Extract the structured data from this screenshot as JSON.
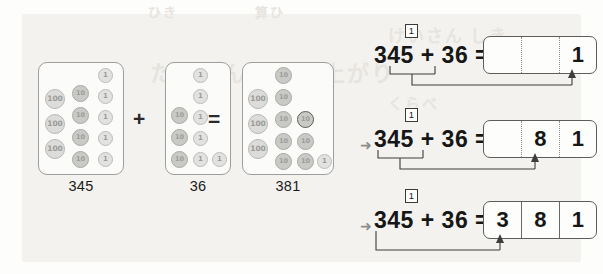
{
  "page": {
    "background_color": "#f3f2ef",
    "ink_color": "#161616"
  },
  "bleed_text": [
    "ひき",
    "算ひ",
    "けいさん",
    "しき",
    "たしざん",
    "くり上がり",
    "くらべ"
  ],
  "coin_model": {
    "operator_plus": "+",
    "operator_equals": "=",
    "groups": [
      {
        "name": "addend-1",
        "label": "345",
        "coins": {
          "hundreds": 3,
          "tens": 4,
          "ones": 5
        },
        "coin_faces": {
          "hundreds": "100",
          "tens": "10",
          "ones": "1"
        }
      },
      {
        "name": "addend-2",
        "label": "36",
        "coins": {
          "hundreds": 0,
          "tens": 3,
          "ones": 6
        },
        "coin_faces": {
          "hundreds": "100",
          "tens": "10",
          "ones": "1"
        }
      },
      {
        "name": "sum",
        "label": "381",
        "coins": {
          "hundreds": 3,
          "tens": 8,
          "ones": 1
        },
        "coin_faces": {
          "hundreds": "100",
          "tens": "10",
          "ones": "1"
        }
      }
    ]
  },
  "steps": [
    {
      "name": "step-ones",
      "step_marker": "",
      "carry": "1",
      "expression": "345 + 36 =",
      "answer_cells": [
        "",
        "",
        "1"
      ],
      "bracket": "ones",
      "cells_solid": false
    },
    {
      "name": "step-tens",
      "step_marker": "➜",
      "carry": "1",
      "expression": "345 + 36 =",
      "answer_cells": [
        "",
        "8",
        "1"
      ],
      "bracket": "tens",
      "cells_solid": false
    },
    {
      "name": "step-hundreds",
      "step_marker": "➜",
      "carry": "1",
      "expression": "345 + 36 =",
      "answer_cells": [
        "3",
        "8",
        "1"
      ],
      "bracket": "hundreds",
      "cells_solid": true
    }
  ]
}
